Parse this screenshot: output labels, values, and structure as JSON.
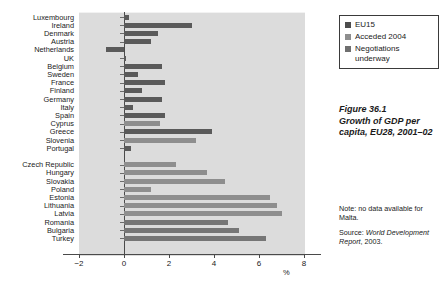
{
  "chart_data": {
    "type": "bar",
    "orientation": "horizontal",
    "title": "Growth of GDP per capita, EU28, 2001–02",
    "figure_number": "Figure 36.1",
    "xlabel": "%",
    "ylabel": "",
    "xlim": [
      -2,
      8
    ],
    "xticks": [
      -2,
      0,
      2,
      4,
      6,
      8
    ],
    "xtick_labels": [
      "−2",
      "0",
      "2",
      "4",
      "6",
      "8"
    ],
    "grid": false,
    "legend_position": "top-right",
    "categories": [
      "Luxembourg",
      "Ireland",
      "Denmark",
      "Austria",
      "Netherlands",
      "UK",
      "Belgium",
      "Sweden",
      "France",
      "Finland",
      "Germany",
      "Italy",
      "Spain",
      "Cyprus",
      "Greece",
      "Slovenia",
      "Portugal",
      "Czech Republic",
      "Hungary",
      "Slovakia",
      "Poland",
      "Estonia",
      "Lithuania",
      "Latvia",
      "Romania",
      "Bulgaria",
      "Turkey"
    ],
    "values": [
      0.2,
      3.0,
      1.5,
      1.2,
      -0.8,
      0.1,
      1.7,
      0.6,
      1.8,
      0.8,
      1.7,
      0.4,
      1.8,
      1.6,
      3.9,
      3.2,
      0.3,
      2.3,
      3.7,
      4.5,
      1.2,
      6.5,
      6.8,
      7.0,
      4.6,
      5.1,
      6.3
    ],
    "groups": [
      "EU15",
      "EU15",
      "EU15",
      "EU15",
      "EU15",
      "EU15",
      "EU15",
      "EU15",
      "EU15",
      "EU15",
      "EU15",
      "EU15",
      "EU15",
      "Acceded 2004",
      "EU15",
      "Acceded 2004",
      "EU15",
      "Acceded 2004",
      "Acceded 2004",
      "Acceded 2004",
      "Acceded 2004",
      "Acceded 2004",
      "Acceded 2004",
      "Acceded 2004",
      "Negotiations underway",
      "Negotiations underway",
      "Negotiations underway"
    ],
    "gap_after_index": 16,
    "series": [
      {
        "name": "EU15",
        "color": "#5a5a5a"
      },
      {
        "name": "Acceded 2004",
        "color": "#8e8e8e"
      },
      {
        "name": "Negotiations underway",
        "color": "#767676"
      }
    ]
  },
  "legend": {
    "items": [
      {
        "label": "EU15",
        "key": "eu15"
      },
      {
        "label": "Acceded 2004",
        "key": "acceded"
      },
      {
        "label": "Negotiations underway",
        "key": "negotiating"
      }
    ]
  },
  "caption": {
    "figure": "Figure 36.1",
    "line1": "Growth of GDP per",
    "line2": "capita, EU28, 2001–02"
  },
  "note": {
    "prefix": "Note:",
    "text": " no data available for Malta."
  },
  "source": {
    "prefix": "Source: ",
    "publication": "World Development Report",
    "suffix": ", 2003."
  },
  "axis": {
    "unit": "%",
    "tick_labels": [
      "−2",
      "0",
      "2",
      "4",
      "6",
      "8"
    ]
  }
}
